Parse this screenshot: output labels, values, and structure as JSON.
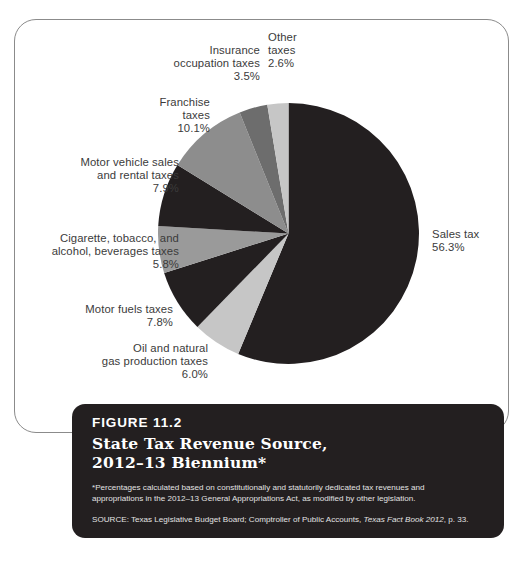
{
  "chart_data": {
    "type": "pie",
    "title": "State Tax Revenue Source, 2012–13 Biennium*",
    "figure_number": "FIGURE 11.2",
    "categories": [
      "Sales tax",
      "Oil and natural gas production taxes",
      "Motor fuels taxes",
      "Cigarette, tobacco, and alcohol, beverages taxes",
      "Motor vehicle sales and rental taxes",
      "Franchise taxes",
      "Insurance occupation taxes",
      "Other taxes"
    ],
    "values": [
      56.3,
      6.0,
      7.8,
      5.8,
      7.9,
      10.1,
      3.5,
      2.6
    ],
    "value_labels": [
      "56.3%",
      "6.0%",
      "7.8%",
      "5.8%",
      "7.9%",
      "10.1%",
      "3.5%",
      "2.6%"
    ],
    "colors": [
      "#231f20",
      "#c6c6c6",
      "#231f20",
      "#9a9a9a",
      "#231f20",
      "#8d8d8d",
      "#6d6d6d",
      "#c6c6c6"
    ],
    "legend_position": "callout-labels",
    "start_angle_deg": 0,
    "direction": "clockwise",
    "xlabel": "",
    "ylabel": ""
  },
  "slices": [
    {
      "name": "sales-tax",
      "label": "Sales tax",
      "pct": "56.3%"
    },
    {
      "name": "oil-gas",
      "label": "Oil and natural\ngas production taxes",
      "pct": "6.0%"
    },
    {
      "name": "motor-fuels",
      "label": "Motor fuels taxes",
      "pct": "7.8%"
    },
    {
      "name": "cigarette-alcohol",
      "label": "Cigarette, tobacco, and\nalcohol, beverages taxes",
      "pct": "5.8%"
    },
    {
      "name": "motor-vehicle",
      "label": "Motor vehicle sales\nand rental taxes",
      "pct": "7.9%"
    },
    {
      "name": "franchise",
      "label": "Franchise\ntaxes",
      "pct": "10.1%"
    },
    {
      "name": "insurance",
      "label": "Insurance\noccupation taxes",
      "pct": "3.5%"
    },
    {
      "name": "other",
      "label": "Other\ntaxes",
      "pct": "2.6%"
    }
  ],
  "labels": {
    "sales_tax": "Sales tax\n56.3%",
    "other": "Other\ntaxes\n2.6%",
    "insurance": "Insurance\noccupation taxes\n3.5%",
    "franchise": "Franchise\ntaxes\n10.1%",
    "motor_vehicle": "Motor vehicle sales\nand rental taxes\n7.9%",
    "cigarette": "Cigarette, tobacco, and\nalcohol, beverages taxes\n5.8%",
    "motor_fuels": "Motor fuels taxes\n7.8%",
    "oil_gas": "Oil and natural\ngas production taxes\n6.0%"
  },
  "caption": {
    "figure_number": "FIGURE 11.2",
    "title": "State Tax Revenue Source,\n2012–13 Biennium*",
    "note": "*Percentages calculated based on constitutionally and statutorily dedicated tax revenues and appropriations in the 2012–13 General Appropriations Act, as modified by other legislation.",
    "source_prefix": "SOURCE: Texas Legislative Budget Board; Comptroller of Public Accounts, ",
    "source_italic": "Texas Fact Book 2012",
    "source_suffix": ", p. 33."
  }
}
